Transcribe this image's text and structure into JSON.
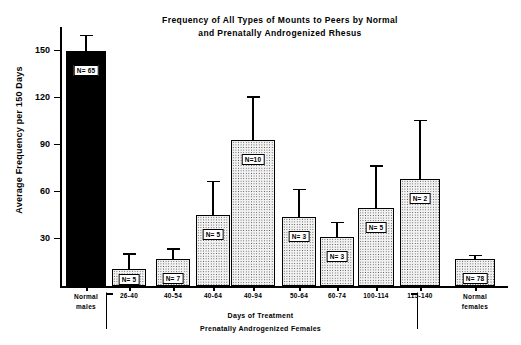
{
  "chart_data": {
    "type": "bar",
    "title": "Frequency of All Types of Mounts to Peers by Normal and  Prenatally Androgenized Rhesus",
    "title_line1": "Frequency of All Types of Mounts to Peers by Normal",
    "title_line2": "and  Prenatally Androgenized Rhesus",
    "ylabel": "Average Frequency per 150 Days",
    "xlabel": "Days of Treatment",
    "xlabel_sub": "Prenatally Androgenized Females",
    "ylim": [
      0,
      165
    ],
    "yticks": [
      30,
      60,
      90,
      120,
      150
    ],
    "grid": false,
    "legend": null,
    "group_left_label_line1": "Normal",
    "group_left_label_line2": "males",
    "group_right_label_line1": "Normal",
    "group_right_label_line2": "females",
    "categories": [
      "Normal males",
      "26-40",
      "40-54",
      "40-64",
      "40-94",
      "50-64",
      "60-74",
      "100-114",
      "115-140",
      "Normal females"
    ],
    "values": [
      150,
      11,
      17,
      45,
      93,
      44,
      31,
      50,
      68,
      17
    ],
    "errors_upper": [
      160,
      21,
      24,
      67,
      121,
      62,
      41,
      77,
      106,
      20
    ],
    "n_labels": [
      "N= 65",
      "N= 5",
      "N= 7",
      "N= 5",
      "N=10",
      "N= 3",
      "N= 3",
      "N= 5",
      "N= 2",
      "N= 78"
    ],
    "n_values": [
      65,
      5,
      7,
      5,
      10,
      3,
      3,
      5,
      2,
      78
    ],
    "bar_styles": [
      "solid",
      "dotted",
      "dotted",
      "dotted",
      "dotted",
      "dotted",
      "dotted",
      "dotted",
      "dotted",
      "dotted"
    ],
    "colors": {
      "solid": "#000000",
      "dotted_fill": "#f2f2f2",
      "axis": "#000000"
    }
  }
}
